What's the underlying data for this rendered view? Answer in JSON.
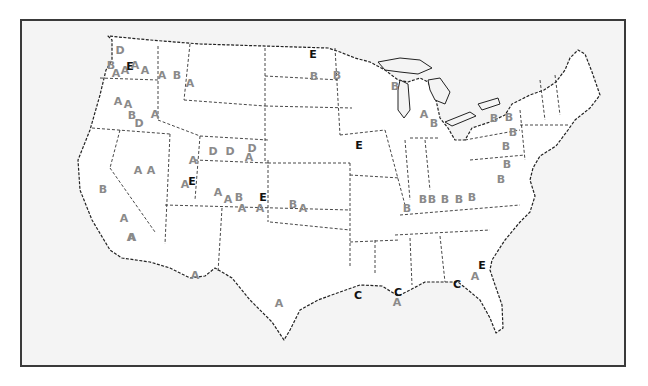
{
  "map": {
    "title": "Continental United States (letter-coded sites)",
    "colors": {
      "frame_border": "#3a3a3a",
      "background": "#f4f4f4",
      "land": "#ffffff",
      "letter_gray": "#8a8a8a",
      "letter_dark": "#111111"
    },
    "labels": [
      {
        "text": "D",
        "x": 120,
        "y": 50,
        "tone": "gray"
      },
      {
        "text": "B",
        "x": 111,
        "y": 65,
        "tone": "gray"
      },
      {
        "text": "A",
        "x": 116,
        "y": 73,
        "tone": "gray"
      },
      {
        "text": "A",
        "x": 125,
        "y": 70,
        "tone": "gray"
      },
      {
        "text": "E",
        "x": 130,
        "y": 66,
        "tone": "dark"
      },
      {
        "text": "A",
        "x": 135,
        "y": 65,
        "tone": "gray"
      },
      {
        "text": "A",
        "x": 145,
        "y": 70,
        "tone": "gray"
      },
      {
        "text": "A",
        "x": 162,
        "y": 75,
        "tone": "gray"
      },
      {
        "text": "B",
        "x": 177,
        "y": 75,
        "tone": "gray"
      },
      {
        "text": "A",
        "x": 190,
        "y": 83,
        "tone": "gray"
      },
      {
        "text": "A",
        "x": 118,
        "y": 101,
        "tone": "gray"
      },
      {
        "text": "A",
        "x": 128,
        "y": 104,
        "tone": "gray"
      },
      {
        "text": "A",
        "x": 155,
        "y": 114,
        "tone": "gray"
      },
      {
        "text": "B",
        "x": 132,
        "y": 115,
        "tone": "gray"
      },
      {
        "text": "D",
        "x": 139,
        "y": 123,
        "tone": "gray"
      },
      {
        "text": "D",
        "x": 213,
        "y": 151,
        "tone": "gray"
      },
      {
        "text": "D",
        "x": 230,
        "y": 151,
        "tone": "gray"
      },
      {
        "text": "D",
        "x": 252,
        "y": 148,
        "tone": "gray"
      },
      {
        "text": "A",
        "x": 249,
        "y": 157,
        "tone": "gray"
      },
      {
        "text": "A",
        "x": 193,
        "y": 160,
        "tone": "gray"
      },
      {
        "text": "A",
        "x": 138,
        "y": 170,
        "tone": "gray"
      },
      {
        "text": "A",
        "x": 151,
        "y": 170,
        "tone": "gray"
      },
      {
        "text": "A",
        "x": 185,
        "y": 184,
        "tone": "gray"
      },
      {
        "text": "E",
        "x": 192,
        "y": 181,
        "tone": "dark"
      },
      {
        "text": "B",
        "x": 103,
        "y": 189,
        "tone": "gray"
      },
      {
        "text": "A",
        "x": 218,
        "y": 192,
        "tone": "gray"
      },
      {
        "text": "A",
        "x": 228,
        "y": 199,
        "tone": "gray"
      },
      {
        "text": "B",
        "x": 239,
        "y": 197,
        "tone": "gray"
      },
      {
        "text": "E",
        "x": 263,
        "y": 197,
        "tone": "dark"
      },
      {
        "text": "A",
        "x": 242,
        "y": 208,
        "tone": "gray"
      },
      {
        "text": "A",
        "x": 260,
        "y": 208,
        "tone": "gray"
      },
      {
        "text": "B",
        "x": 293,
        "y": 204,
        "tone": "gray"
      },
      {
        "text": "A",
        "x": 303,
        "y": 208,
        "tone": "gray"
      },
      {
        "text": "A",
        "x": 124,
        "y": 218,
        "tone": "gray"
      },
      {
        "text": "A",
        "x": 132,
        "y": 237,
        "tone": "gray"
      },
      {
        "text": "A",
        "x": 131,
        "y": 237,
        "tone": "gray"
      },
      {
        "text": "A",
        "x": 195,
        "y": 275,
        "tone": "gray"
      },
      {
        "text": "A",
        "x": 279,
        "y": 303,
        "tone": "gray"
      },
      {
        "text": "E",
        "x": 313,
        "y": 54,
        "tone": "dark"
      },
      {
        "text": "B",
        "x": 314,
        "y": 76,
        "tone": "gray"
      },
      {
        "text": "B",
        "x": 337,
        "y": 75,
        "tone": "gray"
      },
      {
        "text": "B",
        "x": 395,
        "y": 86,
        "tone": "gray"
      },
      {
        "text": "A",
        "x": 424,
        "y": 114,
        "tone": "gray"
      },
      {
        "text": "B",
        "x": 434,
        "y": 123,
        "tone": "gray"
      },
      {
        "text": "E",
        "x": 359,
        "y": 145,
        "tone": "dark"
      },
      {
        "text": "B",
        "x": 407,
        "y": 208,
        "tone": "gray"
      },
      {
        "text": "B",
        "x": 423,
        "y": 199,
        "tone": "gray"
      },
      {
        "text": "B",
        "x": 432,
        "y": 199,
        "tone": "gray"
      },
      {
        "text": "B",
        "x": 445,
        "y": 199,
        "tone": "gray"
      },
      {
        "text": "B",
        "x": 459,
        "y": 199,
        "tone": "gray"
      },
      {
        "text": "B",
        "x": 472,
        "y": 197,
        "tone": "gray"
      },
      {
        "text": "B",
        "x": 494,
        "y": 118,
        "tone": "gray"
      },
      {
        "text": "B",
        "x": 509,
        "y": 117,
        "tone": "gray"
      },
      {
        "text": "B",
        "x": 513,
        "y": 132,
        "tone": "gray"
      },
      {
        "text": "B",
        "x": 506,
        "y": 146,
        "tone": "gray"
      },
      {
        "text": "B",
        "x": 507,
        "y": 164,
        "tone": "gray"
      },
      {
        "text": "B",
        "x": 501,
        "y": 179,
        "tone": "gray"
      },
      {
        "text": "C",
        "x": 358,
        "y": 295,
        "tone": "dark"
      },
      {
        "text": "C",
        "x": 398,
        "y": 292,
        "tone": "dark"
      },
      {
        "text": "A",
        "x": 397,
        "y": 302,
        "tone": "gray"
      },
      {
        "text": "C",
        "x": 457,
        "y": 284,
        "tone": "dark"
      },
      {
        "text": "A",
        "x": 475,
        "y": 276,
        "tone": "gray"
      },
      {
        "text": "E",
        "x": 482,
        "y": 265,
        "tone": "dark"
      }
    ]
  }
}
